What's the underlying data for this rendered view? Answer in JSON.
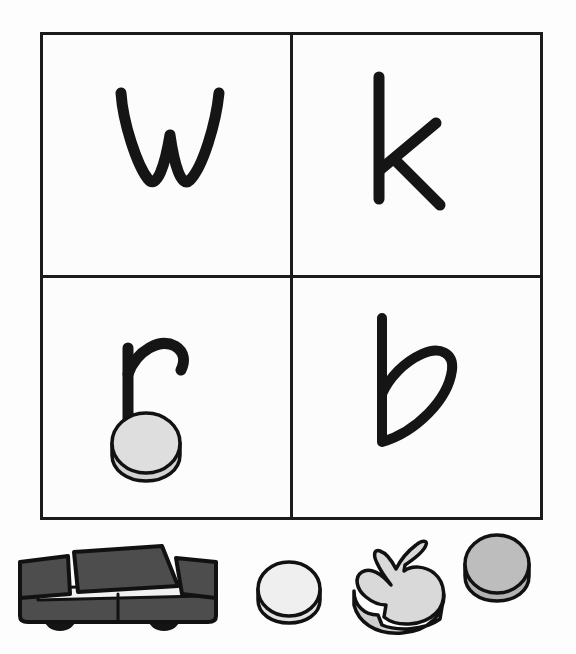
{
  "page": {
    "background_color": "#fdfdfd",
    "ink_color": "#151515"
  },
  "grid": {
    "rows": 2,
    "columns": 2,
    "border_color": "#1b1b1b",
    "cell_background": "#fcfcfc",
    "cells": [
      {
        "position": "top-left",
        "letter": "w",
        "case": "lowercase",
        "has_token": false
      },
      {
        "position": "top-right",
        "letter": "k",
        "case": "lowercase",
        "has_token": false
      },
      {
        "position": "bottom-left",
        "letter": "r",
        "case": "lowercase",
        "has_token": true,
        "token": {
          "shape": "round-disc",
          "color": "#dcdcdc"
        }
      },
      {
        "position": "bottom-right",
        "letter": "b",
        "case": "lowercase",
        "has_token": false
      }
    ]
  },
  "tray": {
    "label": "game pieces",
    "items": [
      {
        "name": "toy-car",
        "shape": "car",
        "color": "#4d4d4d",
        "outline": "#111111"
      },
      {
        "name": "disc-left",
        "shape": "round-disc",
        "color": "#efefef",
        "outline": "#111111"
      },
      {
        "name": "bunny",
        "shape": "rabbit",
        "color": "#d9d9d9",
        "outline": "#111111"
      },
      {
        "name": "disc-right",
        "shape": "round-disc",
        "color": "#bdbdbd",
        "outline": "#111111"
      }
    ]
  },
  "colors": {
    "ink": "#151515",
    "grid_line": "#1b1b1b",
    "car_body": "#4d4d4d",
    "car_dark": "#3a3a3a",
    "disc_light": "#efefef",
    "disc_mid": "#dcdcdc",
    "disc_dark": "#bdbdbd",
    "outline": "#111111",
    "wheel": "#141414"
  }
}
